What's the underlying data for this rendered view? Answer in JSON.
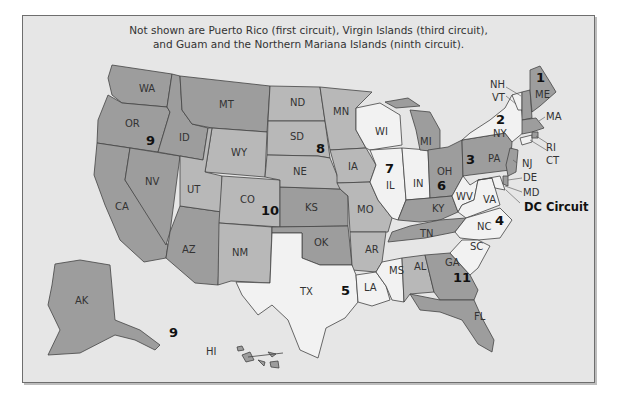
{
  "map": {
    "note_line1": "Not shown are Puerto Rico (first circuit), Virgin Islands (third circuit),",
    "note_line2": "and Guam and the Northern Mariana Islands (ninth circuit).",
    "colors": {
      "background": "#e6e6e6",
      "dark": "#9d9d9d",
      "medium": "#b8b8b8",
      "light": "#f2f2f2",
      "border": "#444444"
    },
    "circuits": [
      {
        "number": "1",
        "states": [
          "ME",
          "NH",
          "MA",
          "RI"
        ]
      },
      {
        "number": "2",
        "states": [
          "NY",
          "VT",
          "CT"
        ]
      },
      {
        "number": "3",
        "states": [
          "PA",
          "NJ",
          "DE"
        ]
      },
      {
        "number": "4",
        "states": [
          "MD",
          "VA",
          "WV",
          "NC",
          "SC"
        ]
      },
      {
        "number": "5",
        "states": [
          "TX",
          "LA",
          "MS"
        ]
      },
      {
        "number": "6",
        "states": [
          "OH",
          "MI",
          "KY",
          "TN"
        ]
      },
      {
        "number": "7",
        "states": [
          "WI",
          "IL",
          "IN"
        ]
      },
      {
        "number": "8",
        "states": [
          "ND",
          "SD",
          "NE",
          "MN",
          "IA",
          "MO",
          "AR"
        ]
      },
      {
        "number": "9",
        "states": [
          "WA",
          "OR",
          "CA",
          "NV",
          "ID",
          "MT",
          "AZ",
          "AK",
          "HI"
        ]
      },
      {
        "number": "10",
        "states": [
          "WY",
          "UT",
          "CO",
          "KS",
          "NM",
          "OK"
        ]
      },
      {
        "number": "11",
        "states": [
          "AL",
          "GA",
          "FL"
        ]
      }
    ],
    "dc_label": "DC Circuit",
    "state_labels": {
      "WA": "WA",
      "OR": "OR",
      "CA": "CA",
      "NV": "NV",
      "ID": "ID",
      "MT": "MT",
      "WY": "WY",
      "UT": "UT",
      "AZ": "AZ",
      "CO": "CO",
      "NM": "NM",
      "ND": "ND",
      "SD": "SD",
      "NE": "NE",
      "KS": "KS",
      "OK": "OK",
      "TX": "TX",
      "MN": "MN",
      "IA": "IA",
      "MO": "MO",
      "AR": "AR",
      "LA": "LA",
      "WI": "WI",
      "IL": "IL",
      "MI": "MI",
      "IN": "IN",
      "OH": "OH",
      "KY": "KY",
      "TN": "TN",
      "MS": "MS",
      "AL": "AL",
      "GA": "GA",
      "FL": "FL",
      "SC": "SC",
      "NC": "NC",
      "VA": "VA",
      "WV": "WV",
      "PA": "PA",
      "NY": "NY",
      "VT": "VT",
      "NH": "NH",
      "ME": "ME",
      "MA": "MA",
      "RI": "RI",
      "CT": "CT",
      "NJ": "NJ",
      "DE": "DE",
      "MD": "MD",
      "AK": "AK",
      "HI": "HI"
    },
    "circuit_labels": {
      "c1": "1",
      "c2": "2",
      "c3": "3",
      "c4": "4",
      "c5": "5",
      "c6": "6",
      "c7": "7",
      "c8": "8",
      "c9": "9",
      "c9b": "9",
      "c10": "10",
      "c11": "11"
    }
  }
}
